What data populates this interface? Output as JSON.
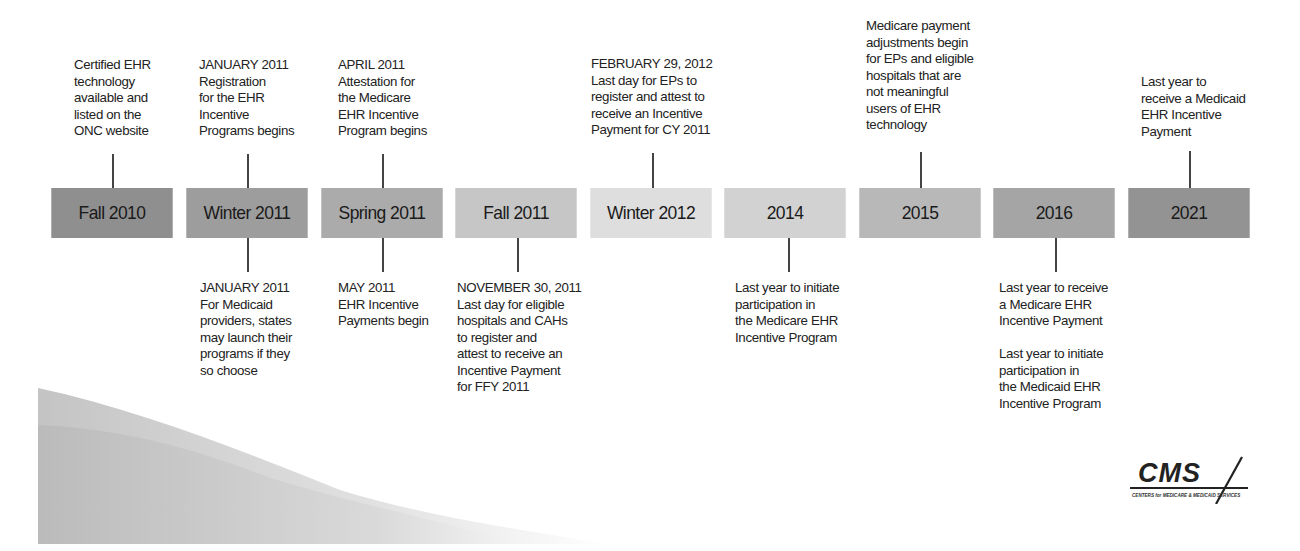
{
  "timeline": {
    "segments": [
      {
        "label": "Fall 2010",
        "color": "#8f8f8f"
      },
      {
        "label": "Winter 2011",
        "color": "#9d9d9d"
      },
      {
        "label": "Spring 2011",
        "color": "#ababab"
      },
      {
        "label": "Fall 2011",
        "color": "#c6c6c6"
      },
      {
        "label": "Winter 2012",
        "color": "#dedede"
      },
      {
        "label": "2014",
        "color": "#d2d2d2"
      },
      {
        "label": "2015",
        "color": "#b8b8b8"
      },
      {
        "label": "2016",
        "color": "#a5a5a5"
      },
      {
        "label": "2021",
        "color": "#939393"
      }
    ],
    "above": [
      {
        "segment": "Fall 2010",
        "text": "Certified EHR\ntechnology\navailable and\nlisted on the\nONC website"
      },
      {
        "segment": "Winter 2011",
        "text": "JANUARY 2011\nRegistration\nfor the EHR\nIncentive\nPrograms begins"
      },
      {
        "segment": "Spring 2011",
        "text": "APRIL 2011\nAttestation for\nthe Medicare\nEHR Incentive\nProgram begins"
      },
      {
        "segment": "Winter 2012",
        "text": "FEBRUARY 29, 2012\nLast day for EPs to\nregister and attest to\nreceive an Incentive\nPayment for CY 2011"
      },
      {
        "segment": "2015",
        "text": "Medicare payment\nadjustments begin\nfor EPs and eligible\nhospitals that are\nnot meaningful\nusers of EHR\ntechnology"
      },
      {
        "segment": "2021",
        "text": "Last year to\nreceive a Medicaid\nEHR Incentive\nPayment"
      }
    ],
    "below": [
      {
        "segment": "Winter 2011",
        "text": "JANUARY 2011\nFor Medicaid\nproviders, states\nmay launch their\nprograms if they\nso choose"
      },
      {
        "segment": "Spring 2011",
        "text": "MAY 2011\nEHR Incentive\nPayments begin"
      },
      {
        "segment": "Fall 2011",
        "text": "NOVEMBER 30, 2011\nLast day for eligible\nhospitals and CAHs\nto register and\nattest to receive an\nIncentive Payment\nfor FFY 2011"
      },
      {
        "segment": "2014",
        "text": "Last year to initiate\nparticipation in\nthe Medicare EHR\nIncentive Program"
      },
      {
        "segment": "2016",
        "text": "Last year to receive\na Medicare EHR\nIncentive Payment\n\nLast year to initiate\nparticipation in\nthe Medicaid EHR\nIncentive Program"
      }
    ]
  },
  "logo": {
    "name": "CMS",
    "tagline": "CENTERS for MEDICARE & MEDICAID SERVICES"
  }
}
